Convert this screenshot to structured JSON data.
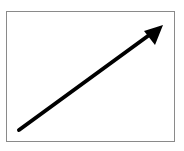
{
  "diagram": {
    "frame": {
      "border_color": "#8a8a8a",
      "fill_color": "#ffffff"
    },
    "arrow": {
      "direction": "up-right",
      "color": "#000000",
      "icon": "arrow-up-right-icon"
    }
  }
}
